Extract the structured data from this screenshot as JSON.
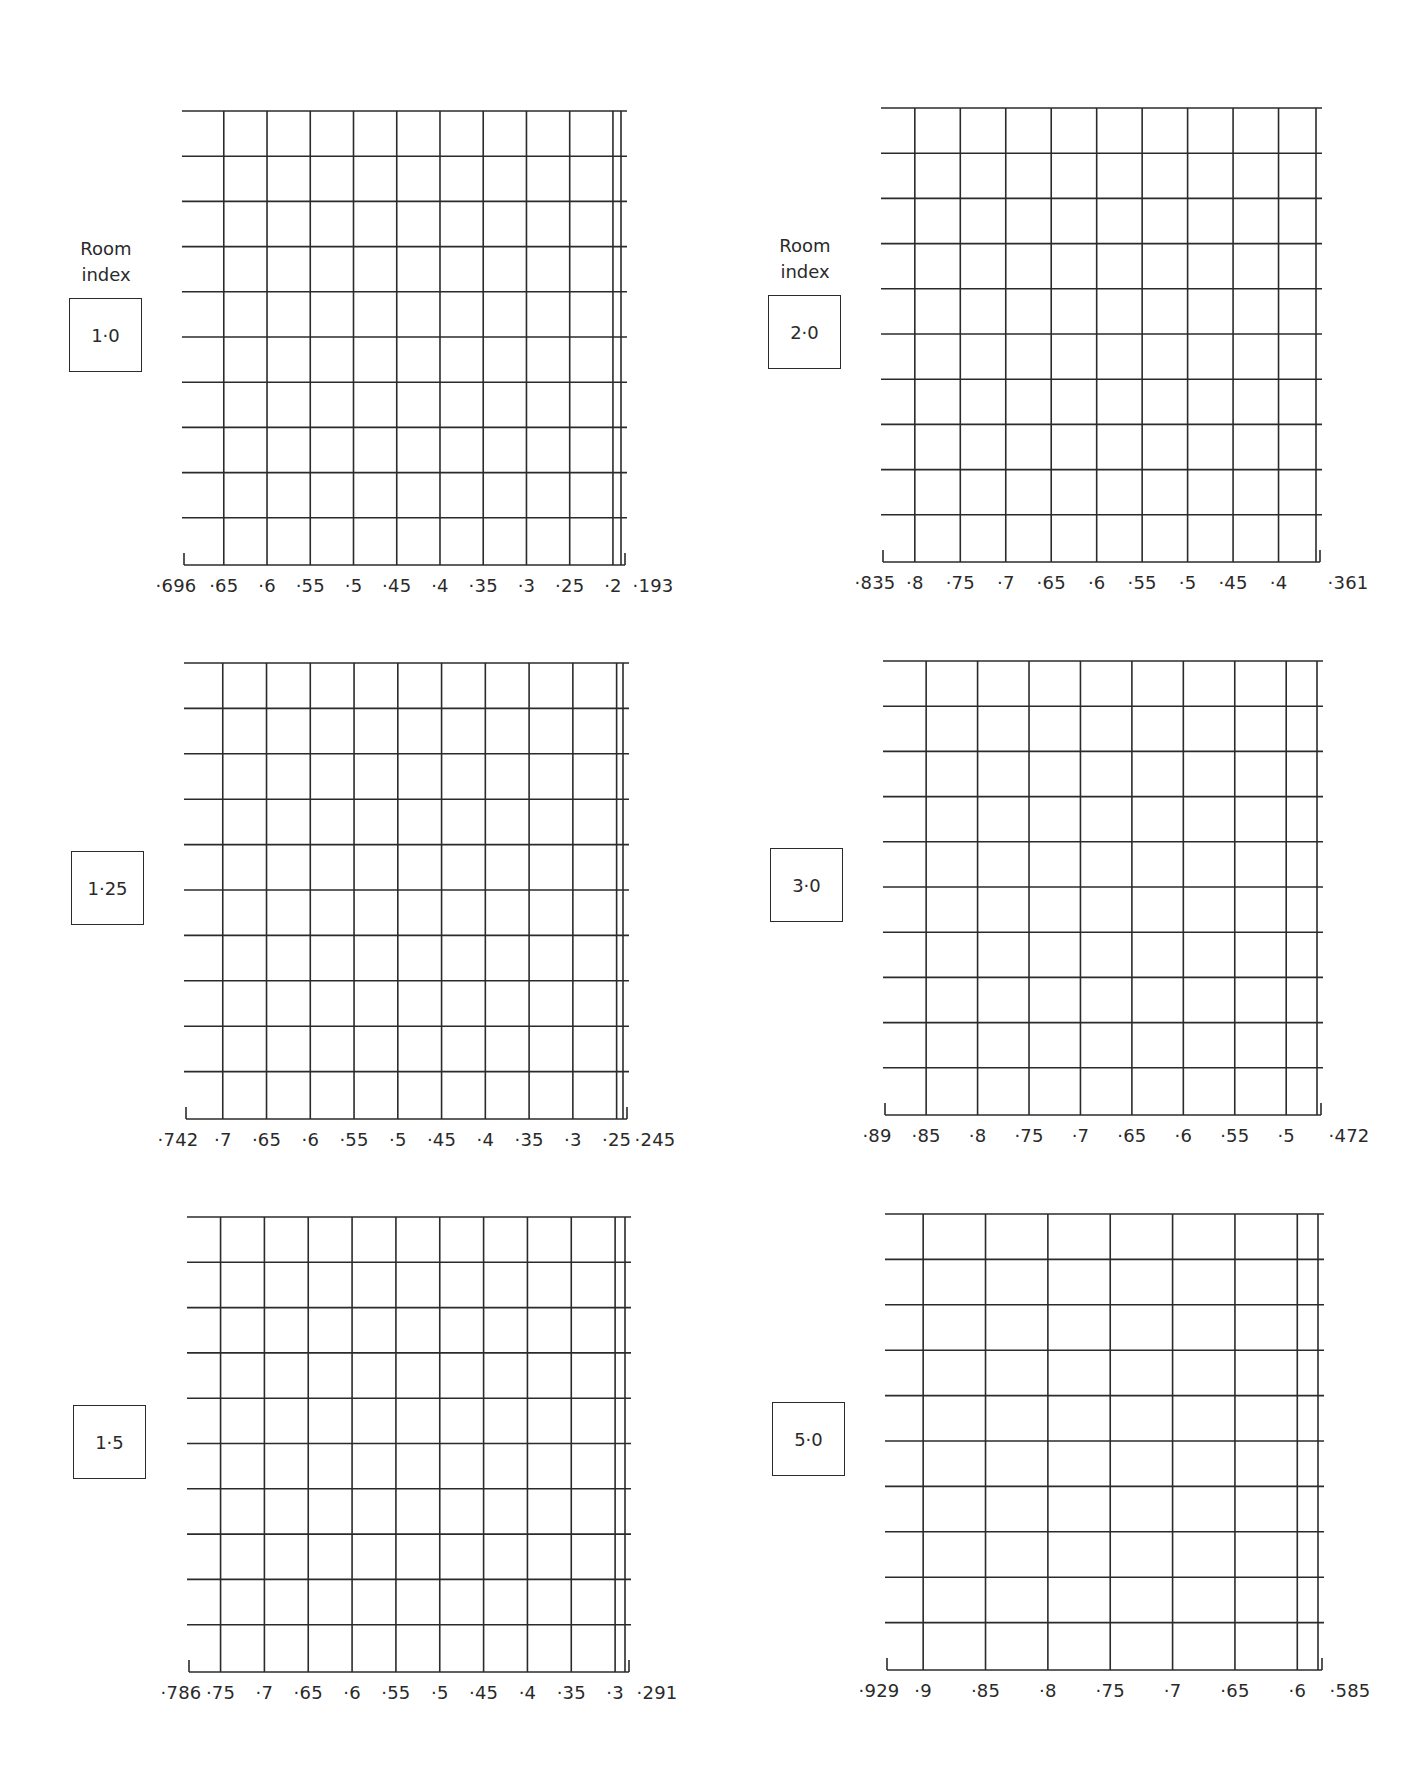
{
  "chart_data": [
    {
      "type": "table",
      "title": "Room index 1·0",
      "room_index_caption": "Room index",
      "room_index": "1·0",
      "x_range": [
        0.696,
        0.193
      ],
      "x_tick_labels": [
        "·696",
        "·65",
        "·6",
        "·55",
        "·5",
        "·45",
        "·4",
        "·35",
        "·3",
        "·25",
        "·2",
        "·193"
      ],
      "x_tick_values": [
        0.696,
        0.65,
        0.6,
        0.55,
        0.5,
        0.45,
        0.4,
        0.35,
        0.3,
        0.25,
        0.2,
        0.193
      ],
      "rows": 10,
      "grid": true
    },
    {
      "type": "table",
      "title": "Room index 2·0",
      "room_index_caption": "Room index",
      "room_index": "2·0",
      "x_range": [
        0.835,
        0.361
      ],
      "x_tick_labels": [
        "·835",
        "·8",
        "·75",
        "·7",
        "·65",
        "·6",
        "·55",
        "·5",
        "·45",
        "·4",
        "·361"
      ],
      "x_tick_values": [
        0.835,
        0.8,
        0.75,
        0.7,
        0.65,
        0.6,
        0.55,
        0.5,
        0.45,
        0.4,
        0.361
      ],
      "rows": 10,
      "grid": true
    },
    {
      "type": "table",
      "title": "Room index 1·25",
      "room_index_caption": "",
      "room_index": "1·25",
      "x_range": [
        0.742,
        0.245
      ],
      "x_tick_labels": [
        "·742",
        "·7",
        "·65",
        "·6",
        "·55",
        "·5",
        "·45",
        "·4",
        "·35",
        "·3",
        "·25",
        "·245"
      ],
      "x_tick_values": [
        0.742,
        0.7,
        0.65,
        0.6,
        0.55,
        0.5,
        0.45,
        0.4,
        0.35,
        0.3,
        0.25,
        0.245
      ],
      "rows": 10,
      "grid": true
    },
    {
      "type": "table",
      "title": "Room index 3·0",
      "room_index_caption": "",
      "room_index": "3·0",
      "x_range": [
        0.89,
        0.472
      ],
      "x_tick_labels": [
        "·89",
        "·85",
        "·8",
        "·75",
        "·7",
        "·65",
        "·6",
        "·55",
        "·5",
        "·472"
      ],
      "x_tick_values": [
        0.89,
        0.85,
        0.8,
        0.75,
        0.7,
        0.65,
        0.6,
        0.55,
        0.5,
        0.472
      ],
      "rows": 10,
      "grid": true
    },
    {
      "type": "table",
      "title": "Room index 1·5",
      "room_index_caption": "",
      "room_index": "1·5",
      "x_range": [
        0.786,
        0.291
      ],
      "x_tick_labels": [
        "·786",
        "·75",
        "·7",
        "·65",
        "·6",
        "·55",
        "·5",
        "·45",
        "·4",
        "·35",
        "·3",
        "·291"
      ],
      "x_tick_values": [
        0.786,
        0.75,
        0.7,
        0.65,
        0.6,
        0.55,
        0.5,
        0.45,
        0.4,
        0.35,
        0.3,
        0.291
      ],
      "rows": 10,
      "grid": true
    },
    {
      "type": "table",
      "title": "Room index 5·0",
      "room_index_caption": "",
      "room_index": "5·0",
      "x_range": [
        0.929,
        0.585
      ],
      "x_tick_labels": [
        "·929",
        "·9",
        "·85",
        "·8",
        "·75",
        "·7",
        "·65",
        "·6",
        "·585"
      ],
      "x_tick_values": [
        0.929,
        0.9,
        0.85,
        0.8,
        0.75,
        0.7,
        0.65,
        0.6,
        0.585
      ],
      "rows": 10,
      "grid": true
    }
  ],
  "panels": [
    {
      "caption_line1": "Room",
      "caption_line2": "index",
      "room_index": "1·0"
    },
    {
      "caption_line1": "Room",
      "caption_line2": "index",
      "room_index": "2·0"
    },
    {
      "caption_line1": "",
      "caption_line2": "",
      "room_index": "1·25"
    },
    {
      "caption_line1": "",
      "caption_line2": "",
      "room_index": "3·0"
    },
    {
      "caption_line1": "",
      "caption_line2": "",
      "room_index": "1·5"
    },
    {
      "caption_line1": "",
      "caption_line2": "",
      "room_index": "5·0"
    }
  ]
}
